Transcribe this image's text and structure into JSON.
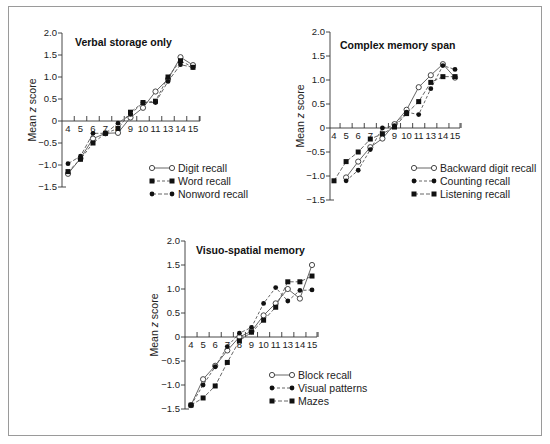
{
  "figure": {
    "frame_color": "#9a9a9a",
    "line_color": "#555555",
    "marker_color": "#111111"
  },
  "chart_data": [
    {
      "type": "line",
      "title": "Verbal storage only",
      "xlabel": "",
      "ylabel": "Mean z score",
      "x": [
        "4",
        "5",
        "6",
        "7",
        "8",
        "9",
        "10",
        "11",
        "13",
        "14",
        "15"
      ],
      "yticks": [
        "2.0",
        "1.5",
        "1.0",
        "0.5",
        "0",
        "-0.5",
        "-1.0",
        "-1.5"
      ],
      "ylim": [
        -1.5,
        2.0
      ],
      "grid": false,
      "legend_position": "lower right",
      "layout": {
        "x0": 62,
        "zeroY": 121,
        "unitY": 44,
        "xStart": 68,
        "xStep": 12.5,
        "xEnd": 200,
        "titleX": 75,
        "titleY": 46,
        "ylabelX": 36,
        "legendX": 152,
        "legendY": 168
      },
      "series": [
        {
          "name": "Digit recall",
          "marker": "open-circle",
          "dash": "",
          "values": [
            -1.2,
            -0.85,
            -0.4,
            -0.28,
            -0.27,
            0.08,
            0.3,
            0.67,
            0.95,
            1.45,
            1.27
          ]
        },
        {
          "name": "Word recall",
          "marker": "square",
          "dash": "3,2",
          "values": [
            -1.15,
            -0.87,
            -0.5,
            -0.28,
            -0.17,
            0.2,
            0.42,
            0.45,
            1.0,
            1.37,
            1.22
          ]
        },
        {
          "name": "Nonword recall",
          "marker": "filled-circle",
          "dash": "4,2",
          "values": [
            -0.97,
            -0.8,
            -0.28,
            -0.28,
            -0.05,
            0.15,
            0.42,
            0.42,
            0.9,
            1.28,
            1.22
          ]
        }
      ]
    },
    {
      "type": "line",
      "title": "Complex memory span",
      "xlabel": "",
      "ylabel": "Mean z score",
      "x": [
        "4",
        "5",
        "6",
        "7",
        "8",
        "9",
        "10",
        "11",
        "13",
        "14",
        "15"
      ],
      "yticks": [
        "2.0",
        "1.5",
        "1.0",
        "0.5",
        "0",
        "-0.5",
        "-1.0",
        "-1.5"
      ],
      "ylim": [
        -1.5,
        2.0
      ],
      "grid": false,
      "legend_position": "lower right",
      "layout": {
        "x0": 330,
        "zeroY": 128,
        "unitY": 48,
        "xStart": 334,
        "xStep": 12.1,
        "xEnd": 460,
        "titleX": 340,
        "titleY": 49,
        "ylabelX": 304,
        "legendX": 414,
        "legendY": 168
      },
      "series": [
        {
          "name": "Backward digit recall",
          "marker": "open-circle",
          "dash": "",
          "values": [
            null,
            -1.03,
            -0.7,
            -0.4,
            -0.22,
            0.08,
            0.38,
            0.85,
            1.1,
            1.33,
            1.05
          ]
        },
        {
          "name": "Counting recall",
          "marker": "filled-circle",
          "dash": "3,2",
          "values": [
            null,
            -1.1,
            -0.88,
            -0.45,
            0.0,
            0.05,
            0.33,
            0.28,
            0.82,
            1.3,
            1.22
          ]
        },
        {
          "name": "Listening recall",
          "marker": "square",
          "dash": "4,2",
          "values": [
            -1.1,
            -0.7,
            -0.5,
            -0.23,
            -0.12,
            0.02,
            0.3,
            0.55,
            0.95,
            1.07,
            1.07
          ]
        }
      ]
    },
    {
      "type": "line",
      "title": "Visuo-spatial memory",
      "xlabel": "",
      "ylabel": "Mean z score",
      "x": [
        "4",
        "5",
        "6",
        "7",
        "8",
        "9",
        "10",
        "11",
        "13",
        "14",
        "15"
      ],
      "yticks": [
        "2.0",
        "1.5",
        "1.0",
        "0.5",
        "0",
        "-0.5",
        "-1.0",
        "-1.5"
      ],
      "ylim": [
        -1.5,
        2.0
      ],
      "grid": false,
      "legend_position": "lower right",
      "layout": {
        "x0": 185,
        "zeroY": 337,
        "unitY": 48,
        "xStart": 191,
        "xStep": 12.1,
        "xEnd": 317,
        "titleX": 196,
        "titleY": 254,
        "ylabelX": 158,
        "legendX": 272,
        "legendY": 375
      },
      "series": [
        {
          "name": "Block recall",
          "marker": "open-circle",
          "dash": "",
          "values": [
            -1.42,
            -0.88,
            -0.6,
            -0.28,
            0.0,
            0.12,
            0.45,
            0.7,
            1.0,
            0.8,
            1.5
          ]
        },
        {
          "name": "Visual patterns",
          "marker": "filled-circle",
          "dash": "3,2",
          "values": [
            -1.42,
            -1.0,
            -0.62,
            -0.2,
            0.08,
            0.2,
            0.7,
            1.03,
            0.75,
            0.97,
            0.98
          ]
        },
        {
          "name": "Mazes",
          "marker": "square",
          "dash": "4,2",
          "values": [
            -1.42,
            -1.27,
            -1.02,
            -0.53,
            -0.08,
            0.1,
            0.35,
            0.62,
            1.15,
            1.15,
            1.27
          ]
        }
      ]
    }
  ]
}
